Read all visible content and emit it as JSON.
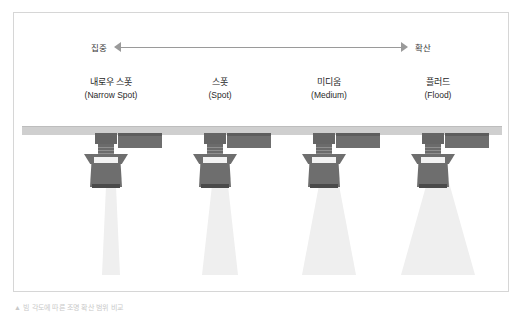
{
  "figure": {
    "spread_axis": {
      "left_label": "집중",
      "right_label": "확산"
    },
    "fixtures": [
      {
        "id": "narrow-spot",
        "ko": "내로우 스폿",
        "en": "(Narrow Spot)",
        "center_x": 97,
        "beam_top_width": 12,
        "beam_bottom_width": 18,
        "beam_length": 100
      },
      {
        "id": "spot",
        "ko": "스폿",
        "en": "(Spot)",
        "center_x": 206,
        "beam_top_width": 14,
        "beam_bottom_width": 36,
        "beam_length": 100
      },
      {
        "id": "medium",
        "ko": "미디움",
        "en": "(Medium)",
        "center_x": 315,
        "beam_top_width": 16,
        "beam_bottom_width": 54,
        "beam_length": 100
      },
      {
        "id": "flood",
        "ko": "플러드",
        "en": "(Flood)",
        "center_x": 424,
        "beam_top_width": 18,
        "beam_bottom_width": 74,
        "beam_length": 100
      }
    ],
    "colors": {
      "border": "#d6d6d6",
      "track": "#cfcfcf",
      "fixture_body": "#6e6e6e",
      "fixture_dark": "#5d5d5d",
      "beam": "#efefef",
      "text": "#1e1e1e",
      "arrow": "#9a9a9a"
    },
    "footnote": "▲ 빔 각도에 따른 조명 확산 범위 비교"
  }
}
